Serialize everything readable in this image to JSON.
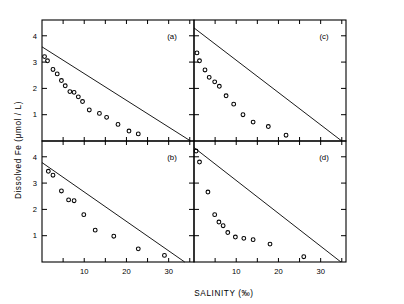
{
  "chart_data": {
    "type": "scatter",
    "title": "",
    "xlabel": "SALINITY (‰)",
    "ylabel": "Dissolved Fe  (μmol / L)",
    "xlim": [
      0,
      36
    ],
    "ylim": [
      0,
      4.6
    ],
    "xticks": [
      0,
      5,
      10,
      15,
      20,
      25,
      30,
      35
    ],
    "xticklabels": [
      "",
      "",
      "10",
      "",
      "20",
      "",
      "30",
      ""
    ],
    "yticks": [
      1,
      2,
      3,
      4
    ],
    "yticklabels": [
      "1",
      "2",
      "3",
      "4"
    ],
    "grid": false,
    "legend": null,
    "marker": "open-circle",
    "panel_layout": "2x2",
    "panels": [
      {
        "label": "(a)",
        "position": "top-left",
        "dilution_line": {
          "x0": 0.0,
          "y0": 3.58,
          "x1": 35.2,
          "y1": 0.0
        },
        "points": [
          {
            "x": 0.6,
            "y": 3.21
          },
          {
            "x": 1.3,
            "y": 3.05
          },
          {
            "x": 2.6,
            "y": 2.72
          },
          {
            "x": 3.6,
            "y": 2.55
          },
          {
            "x": 4.6,
            "y": 2.3
          },
          {
            "x": 5.5,
            "y": 2.1
          },
          {
            "x": 6.6,
            "y": 1.88
          },
          {
            "x": 7.6,
            "y": 1.85
          },
          {
            "x": 8.6,
            "y": 1.68
          },
          {
            "x": 9.6,
            "y": 1.5
          },
          {
            "x": 11.2,
            "y": 1.18
          },
          {
            "x": 13.6,
            "y": 1.05
          },
          {
            "x": 15.3,
            "y": 0.9
          },
          {
            "x": 18.0,
            "y": 0.63
          },
          {
            "x": 20.6,
            "y": 0.38
          },
          {
            "x": 22.8,
            "y": 0.27
          }
        ]
      },
      {
        "label": "(b)",
        "position": "bottom-left",
        "dilution_line": {
          "x0": 0.0,
          "y0": 3.78,
          "x1": 33.8,
          "y1": 0.0
        },
        "points": [
          {
            "x": 1.5,
            "y": 3.45
          },
          {
            "x": 2.6,
            "y": 3.3
          },
          {
            "x": 4.6,
            "y": 2.7
          },
          {
            "x": 6.3,
            "y": 2.36
          },
          {
            "x": 7.6,
            "y": 2.33
          },
          {
            "x": 9.9,
            "y": 1.8
          },
          {
            "x": 12.6,
            "y": 1.21
          },
          {
            "x": 17.0,
            "y": 0.98
          },
          {
            "x": 22.8,
            "y": 0.5
          },
          {
            "x": 29.0,
            "y": 0.25
          }
        ]
      },
      {
        "label": "(c)",
        "position": "top-right",
        "dilution_line": {
          "x0": 0.0,
          "y0": 4.3,
          "x1": 35.0,
          "y1": 0.0
        },
        "points": [
          {
            "x": 0.7,
            "y": 3.35
          },
          {
            "x": 1.3,
            "y": 3.05
          },
          {
            "x": 2.6,
            "y": 2.7
          },
          {
            "x": 3.6,
            "y": 2.42
          },
          {
            "x": 4.9,
            "y": 2.25
          },
          {
            "x": 6.0,
            "y": 2.08
          },
          {
            "x": 7.6,
            "y": 1.72
          },
          {
            "x": 9.4,
            "y": 1.4
          },
          {
            "x": 11.6,
            "y": 1.0
          },
          {
            "x": 14.0,
            "y": 0.72
          },
          {
            "x": 17.6,
            "y": 0.55
          },
          {
            "x": 21.8,
            "y": 0.22
          }
        ]
      },
      {
        "label": "(d)",
        "position": "bottom-right",
        "dilution_line": {
          "x0": 0.0,
          "y0": 4.35,
          "x1": 34.8,
          "y1": 0.0
        },
        "points": [
          {
            "x": 0.5,
            "y": 4.22
          },
          {
            "x": 1.3,
            "y": 3.8
          },
          {
            "x": 3.3,
            "y": 2.66
          },
          {
            "x": 4.9,
            "y": 1.8
          },
          {
            "x": 5.9,
            "y": 1.52
          },
          {
            "x": 6.9,
            "y": 1.38
          },
          {
            "x": 8.0,
            "y": 1.12
          },
          {
            "x": 9.8,
            "y": 0.95
          },
          {
            "x": 11.8,
            "y": 0.9
          },
          {
            "x": 14.0,
            "y": 0.85
          },
          {
            "x": 18.0,
            "y": 0.68
          },
          {
            "x": 26.0,
            "y": 0.2
          }
        ]
      }
    ]
  },
  "colors": {
    "axis": "#000000",
    "marker": "#000000",
    "line": "#000000",
    "background": "#ffffff"
  }
}
